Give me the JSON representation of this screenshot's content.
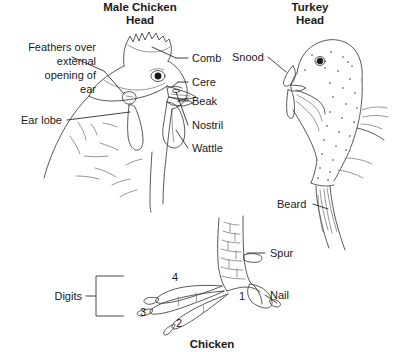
{
  "figure": {
    "background_color": "#ffffff",
    "ink_color": "#3c3c3c",
    "text_color": "#1a1a1a",
    "caption": "Chicken"
  },
  "panels": {
    "chicken_head": {
      "title_line1": "Male Chicken",
      "title_line2": "Head",
      "labels_left": {
        "feathers_line1": "Feathers over",
        "feathers_line2": "external",
        "feathers_line3": "opening of",
        "feathers_line4": "ear",
        "ear_lobe": "Ear lobe"
      },
      "labels_right": {
        "comb": "Comb",
        "cere": "Cere",
        "beak": "Beak",
        "nostril": "Nostril",
        "wattle": "Wattle"
      }
    },
    "turkey_head": {
      "title_line1": "Turkey",
      "title_line2": "Head",
      "labels": {
        "snood": "Snood",
        "beard": "Beard"
      }
    },
    "chicken_foot": {
      "caption": "Chicken",
      "labels": {
        "spur": "Spur",
        "nail": "Nail",
        "digits": "Digits"
      },
      "digit_numbers": {
        "one": "1",
        "two": "2",
        "three": "3",
        "four": "4"
      }
    }
  }
}
